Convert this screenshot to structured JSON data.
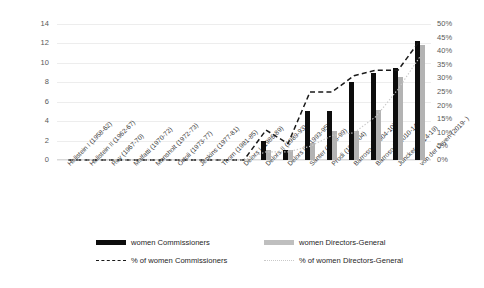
{
  "chart_data": {
    "type": "bar",
    "title": "",
    "xlabel": "",
    "ylabel": "",
    "categories": [
      "Hallstein I (1958-62)",
      "Hallstein II (1962-67)",
      "Rey (1967-70)",
      "Malfatti (1970-72)",
      "Mansholt (1972-73)",
      "Ortoli (1973-77)",
      "Jenkins (1977-81)",
      "Thorn (1981-85)",
      "Delors I (1986-89)",
      "Delors II (1989-93)",
      "Delors III (1993-95)",
      "Santer (1995-99)",
      "Prodi (1999-04)",
      "Barroso I (2004-10)",
      "Barroso II (2010-14)",
      "Juncker (2014-19)",
      "von der Leyen (2019- )"
    ],
    "series": [
      {
        "name": "women Commissioners",
        "axis": "left",
        "kind": "bar",
        "color": "#0d0d0d",
        "values": [
          0,
          0,
          0,
          0,
          0,
          0,
          0,
          0,
          0,
          2,
          1,
          5,
          5,
          8,
          9,
          9.5,
          12.3
        ]
      },
      {
        "name": "women Directors-General",
        "axis": "left",
        "kind": "bar",
        "color": "#b3b3b3",
        "values": [
          0,
          0,
          0,
          0,
          0,
          0,
          0,
          0,
          0,
          1,
          1,
          1.8,
          3,
          3,
          5.2,
          8.5,
          11.8
        ]
      },
      {
        "name": "% of women Commissioners",
        "axis": "right",
        "kind": "line-dashed",
        "color": "#1a1a1a",
        "values": [
          0,
          0,
          0,
          0,
          0,
          0,
          0,
          0,
          0,
          11,
          6,
          25,
          25,
          31,
          33,
          33,
          44
        ]
      },
      {
        "name": "% of women Directors-General",
        "axis": "right",
        "kind": "line-dotted",
        "color": "#c9c9c9",
        "values": [
          0,
          0,
          0,
          0,
          0,
          0,
          0,
          0,
          0,
          3,
          3,
          5,
          9,
          10,
          16,
          26,
          38
        ]
      }
    ],
    "y_left": {
      "min": 0,
      "max": 14,
      "step": 2,
      "ticks": [
        "0",
        "2",
        "4",
        "6",
        "8",
        "10",
        "12",
        "14"
      ]
    },
    "y_right": {
      "min": 0,
      "max": 50,
      "step": 5,
      "ticks": [
        "0%",
        "5%",
        "10%",
        "15%",
        "20%",
        "25%",
        "30%",
        "35%",
        "40%",
        "45%",
        "50%"
      ]
    },
    "grid": true,
    "legend_position": "bottom"
  },
  "legend": {
    "entries": [
      {
        "label": "women Commissioners",
        "marker": "bar-black"
      },
      {
        "label": "women Directors-General",
        "marker": "bar-gray"
      },
      {
        "label": "% of women Commissioners",
        "marker": "line-dashed-black"
      },
      {
        "label": "% of women Directors-General",
        "marker": "line-dotted-gray"
      }
    ]
  }
}
